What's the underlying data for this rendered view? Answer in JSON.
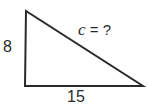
{
  "diagram": {
    "type": "right-triangle",
    "stroke_color": "#2a2a2a",
    "vertices": {
      "top_left": [
        26,
        11
      ],
      "bottom_left": [
        25,
        86
      ],
      "bottom_right": [
        143,
        86
      ]
    },
    "labels": {
      "vertical_leg": "8",
      "horizontal_leg": "15",
      "hypotenuse_var": "c",
      "hypotenuse_rest": " = ?"
    }
  }
}
